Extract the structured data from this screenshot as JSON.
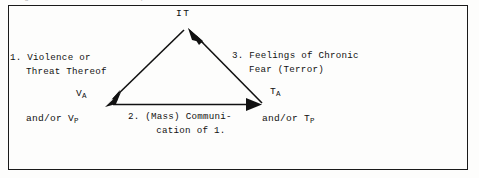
{
  "figure": {
    "caption_sliver": "Diagram of the terrorism process",
    "frame": {
      "border_color": "#1a1a1a"
    },
    "nodes": {
      "apex": {
        "id": "IT",
        "label": "IT"
      },
      "left": {
        "id": "V_A",
        "label_main": "V",
        "label_sub": "A",
        "label_alt_prefix": "and/or V",
        "label_alt_sub": "P"
      },
      "right": {
        "id": "T_A",
        "label_main": "T",
        "label_sub": "A",
        "label_alt_prefix": "and/or T",
        "label_alt_sub": "P"
      }
    },
    "edges": [
      {
        "number": "1.",
        "line1": "1. Violence or",
        "line2": "Threat Thereof",
        "from": "IT",
        "to": "V_A",
        "arrowhead": "at-V_A"
      },
      {
        "number": "2.",
        "line1": "2. (Mass) Communi-",
        "line2": "cation of 1.",
        "from": "V_A",
        "to": "T_A",
        "arrowhead": "at-T_A"
      },
      {
        "number": "3.",
        "line1": "3. Feelings of Chronic",
        "line2": "Fear (Terror)",
        "from": "T_A",
        "to": "IT",
        "arrowhead": "at-IT"
      }
    ]
  }
}
